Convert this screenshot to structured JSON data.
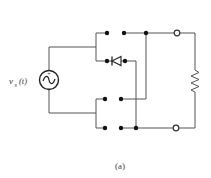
{
  "figure": {
    "caption": "(a)",
    "source": {
      "label_main": "v",
      "label_sub": "s",
      "label_arg": "(t)",
      "plus": "+",
      "minus": "−",
      "wave": "~"
    },
    "components": {
      "source": "ac-voltage-source",
      "diode": "diode",
      "load": "resistor",
      "terminals": [
        "output-terminal-top",
        "output-terminal-bottom"
      ],
      "switch_nodes": 10
    },
    "colors": {
      "wire": "#555555",
      "node": "#111111",
      "background": "#ffffff"
    }
  }
}
